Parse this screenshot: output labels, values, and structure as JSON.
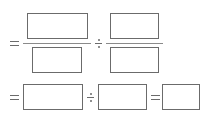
{
  "worksheet": {
    "row1": {
      "operator_equals": "=",
      "fraction1": {
        "numerator": "",
        "denominator": ""
      },
      "operator_divide": "÷",
      "fraction2": {
        "numerator": "",
        "denominator": ""
      }
    },
    "row2": {
      "operator_equals_1": "=",
      "box1": "",
      "operator_divide": "÷",
      "box2": "",
      "operator_equals_2": "=",
      "box3": ""
    }
  }
}
